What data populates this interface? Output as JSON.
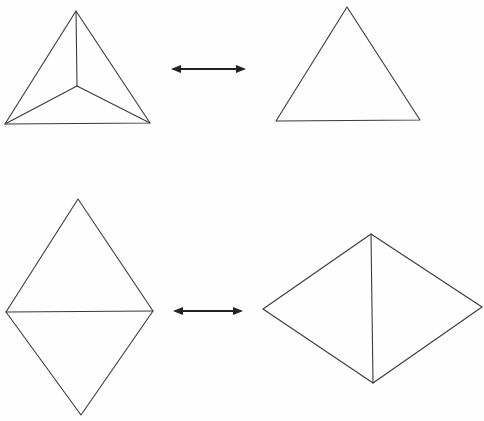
{
  "figure": {
    "description": "Dual polyhedra correspondence: tetrahedron (vertex-centered projection) with triangle, and triangular bipyramid (two triangles) with diamond",
    "rows": [
      {
        "left": {
          "name": "tetrahedron-projection",
          "shape": "triangle subdivided from an interior point to each vertex"
        },
        "relation": "double-arrow",
        "right": {
          "name": "triangle",
          "shape": "single triangle"
        }
      },
      {
        "left": {
          "name": "diamond-horizontal-split",
          "shape": "two triangles sharing a horizontal edge"
        },
        "relation": "double-arrow",
        "right": {
          "name": "diamond-vertical-split",
          "shape": "two triangles sharing a vertical edge"
        }
      }
    ],
    "colors": {
      "line": "#3a3a3a",
      "arrow": "#222222",
      "background": "#fefefe"
    }
  }
}
